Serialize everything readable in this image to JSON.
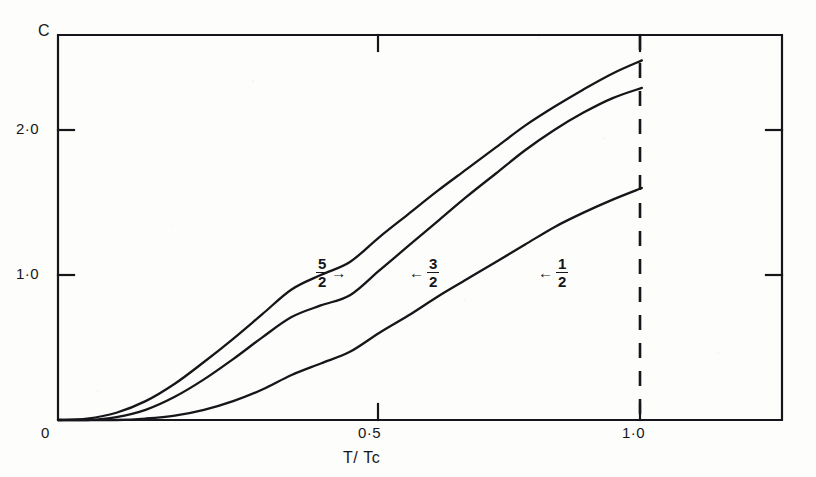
{
  "figure": {
    "background_color": "#fdfdfc",
    "ink_color": "#16161a"
  },
  "axes": {
    "y_title": "C",
    "x_title": "T/ Tc",
    "origin_label": "0",
    "y_ticks": [
      "1·0",
      "2·0"
    ],
    "x_ticks": [
      "0·5",
      "1·0"
    ]
  },
  "curve_labels": [
    {
      "name": "spin-five-halves",
      "numerator": "5",
      "denominator": "2",
      "arrow": "→"
    },
    {
      "name": "spin-three-halves",
      "numerator": "3",
      "denominator": "2",
      "arrow": "←"
    },
    {
      "name": "spin-one-half",
      "numerator": "1",
      "denominator": "2",
      "arrow": "←"
    }
  ],
  "chart_data": {
    "type": "line",
    "title": "",
    "xlabel": "T/ Tc",
    "ylabel": "C",
    "xlim": [
      0,
      1.24
    ],
    "ylim": [
      0,
      2.655
    ],
    "grid": false,
    "legend": "inline-arrow-annotations",
    "x_tick_values": [
      0,
      0.5,
      1.0
    ],
    "x_tick_labels": [
      "0",
      "0·5",
      "1·0"
    ],
    "y_tick_values": [
      1.0,
      2.0
    ],
    "y_tick_labels": [
      "1·0",
      "2·0"
    ],
    "critical_line": {
      "x": 1.0,
      "style": "dashed",
      "label": "1·0"
    },
    "series": [
      {
        "name": "5/2",
        "label_numerator": "5",
        "label_denominator": "2",
        "x": [
          0,
          0.05,
          0.1,
          0.15,
          0.2,
          0.25,
          0.3,
          0.35,
          0.4,
          0.45,
          0.5,
          0.55,
          0.6,
          0.65,
          0.7,
          0.75,
          0.8,
          0.85,
          0.9,
          0.95,
          1.0
        ],
        "y": [
          0,
          0.01,
          0.05,
          0.13,
          0.25,
          0.4,
          0.56,
          0.73,
          0.9,
          1.0,
          1.09,
          1.26,
          1.42,
          1.58,
          1.73,
          1.88,
          2.03,
          2.16,
          2.28,
          2.39,
          2.48
        ]
      },
      {
        "name": "3/2",
        "label_numerator": "3",
        "label_denominator": "2",
        "x": [
          0,
          0.05,
          0.1,
          0.15,
          0.2,
          0.25,
          0.3,
          0.35,
          0.4,
          0.45,
          0.5,
          0.55,
          0.6,
          0.65,
          0.7,
          0.75,
          0.8,
          0.85,
          0.9,
          0.95,
          1.0
        ],
        "y": [
          0,
          0.0,
          0.02,
          0.07,
          0.16,
          0.28,
          0.42,
          0.57,
          0.71,
          0.79,
          0.86,
          1.03,
          1.2,
          1.37,
          1.54,
          1.7,
          1.86,
          2.0,
          2.12,
          2.22,
          2.29
        ]
      },
      {
        "name": "1/2",
        "label_numerator": "1",
        "label_denominator": "2",
        "x": [
          0,
          0.05,
          0.1,
          0.15,
          0.2,
          0.25,
          0.3,
          0.35,
          0.4,
          0.45,
          0.5,
          0.55,
          0.6,
          0.65,
          0.7,
          0.75,
          0.8,
          0.85,
          0.9,
          0.95,
          1.0
        ],
        "y": [
          0,
          0.0,
          0.0,
          0.01,
          0.03,
          0.07,
          0.13,
          0.21,
          0.31,
          0.39,
          0.47,
          0.6,
          0.72,
          0.85,
          0.97,
          1.09,
          1.21,
          1.33,
          1.43,
          1.52,
          1.6
        ]
      }
    ]
  }
}
